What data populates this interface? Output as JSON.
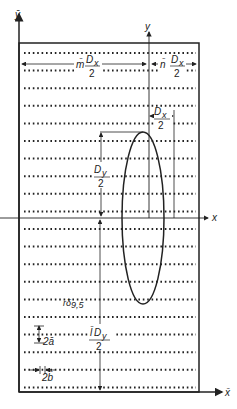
{
  "figure": {
    "type": "diagram",
    "axes": {
      "global_y_label": "ȳ",
      "global_x_label": "x̄",
      "local_y_label": "y",
      "local_x_label": "x"
    },
    "dimension_labels": {
      "m_dx": {
        "prefix": "m̄",
        "num": "D",
        "sub": "x",
        "den": "2"
      },
      "n_dx": {
        "prefix": "n̄",
        "num": "D",
        "sub": "x",
        "den": "2"
      },
      "ellipse_dx": {
        "num": "D",
        "sub": "x",
        "den": "2"
      },
      "ellipse_dy": {
        "num": "D",
        "sub": "y",
        "den": "2"
      },
      "l_dy": {
        "prefix": "l̄",
        "num": "D",
        "sub": "y",
        "den": "2"
      },
      "row_spacing": "2ā",
      "dot_spacing": "2b̄",
      "delta_label": "δ",
      "delta_sub": "9,5"
    },
    "colors": {
      "ink": "#222222",
      "background": "#ffffff"
    },
    "rows": {
      "count": 20,
      "first_y": 53,
      "spacing": 17.6
    }
  }
}
